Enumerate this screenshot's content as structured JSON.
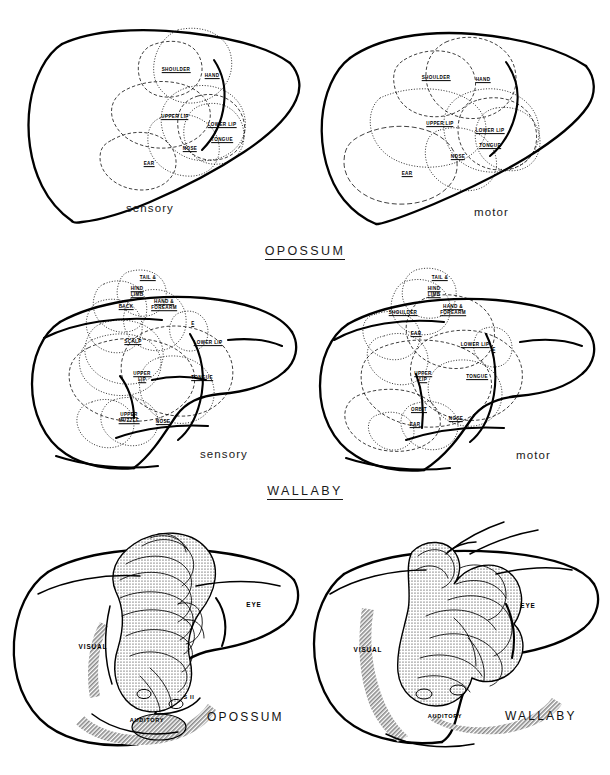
{
  "figure": {
    "background": "#ffffff",
    "ink": "#000000",
    "sections": [
      {
        "id": "opossum-cortex",
        "heading": "OPOSSUM"
      },
      {
        "id": "wallaby-cortex",
        "heading": "WALLABY"
      }
    ]
  },
  "panels": {
    "opossum_sensory": {
      "caption": "sensory",
      "species": "OPOSSUM",
      "modality": "sensory",
      "labels": [
        {
          "text": "SHOULDER",
          "x": 176,
          "y": 70
        },
        {
          "text": "HAND",
          "x": 212,
          "y": 76
        },
        {
          "text": "UPPER LIP",
          "x": 175,
          "y": 117
        },
        {
          "text": "LOWER LIP",
          "x": 222,
          "y": 125
        },
        {
          "text": "TONGUE",
          "x": 222,
          "y": 140
        },
        {
          "text": "NOSE",
          "x": 190,
          "y": 149
        },
        {
          "text": "EAR",
          "x": 149,
          "y": 164
        }
      ]
    },
    "opossum_motor": {
      "caption": "motor",
      "species": "OPOSSUM",
      "modality": "motor",
      "labels": [
        {
          "text": "SHOULDER",
          "x": 436,
          "y": 78
        },
        {
          "text": "HAND",
          "x": 483,
          "y": 80
        },
        {
          "text": "UPPER LIP",
          "x": 440,
          "y": 124
        },
        {
          "text": "LOWER LIP",
          "x": 490,
          "y": 131
        },
        {
          "text": "TONGUE",
          "x": 490,
          "y": 146
        },
        {
          "text": "NOSE",
          "x": 458,
          "y": 157
        },
        {
          "text": "EAR",
          "x": 407,
          "y": 174
        }
      ]
    },
    "wallaby_sensory": {
      "caption": "sensory",
      "species": "WALLABY",
      "modality": "sensory",
      "labels": [
        {
          "text": "TAIL &",
          "x": 148,
          "y": 278
        },
        {
          "text": "HIND|LIMB",
          "x": 137,
          "y": 292
        },
        {
          "text": "BACK",
          "x": 126,
          "y": 307
        },
        {
          "text": "HAND &|FOREARM",
          "x": 164,
          "y": 305
        },
        {
          "text": "E",
          "x": 193,
          "y": 324
        },
        {
          "text": "SCALP",
          "x": 133,
          "y": 342
        },
        {
          "text": "LOWER LIP",
          "x": 208,
          "y": 343
        },
        {
          "text": "UPPER|LIP",
          "x": 142,
          "y": 377
        },
        {
          "text": "TONGUE",
          "x": 202,
          "y": 378
        },
        {
          "text": "UPPER|MUZZLE",
          "x": 129,
          "y": 418
        },
        {
          "text": "NOSE",
          "x": 163,
          "y": 422
        }
      ]
    },
    "wallaby_motor": {
      "caption": "motor",
      "species": "WALLABY",
      "modality": "motor",
      "labels": [
        {
          "text": "TAIL &",
          "x": 440,
          "y": 278
        },
        {
          "text": "HIND|LIMB",
          "x": 434,
          "y": 292
        },
        {
          "text": "SHOULDER",
          "x": 403,
          "y": 313
        },
        {
          "text": "HAND &|FOREARM",
          "x": 453,
          "y": 310
        },
        {
          "text": "EAR",
          "x": 416,
          "y": 334
        },
        {
          "text": "LOWER LIP",
          "x": 475,
          "y": 345
        },
        {
          "text": "E",
          "x": 494,
          "y": 350
        },
        {
          "text": "UPPER|LIP",
          "x": 423,
          "y": 377
        },
        {
          "text": "TONGUE",
          "x": 477,
          "y": 377
        },
        {
          "text": "ORBIT",
          "x": 419,
          "y": 410
        },
        {
          "text": "EAR",
          "x": 415,
          "y": 425
        },
        {
          "text": "NOSE",
          "x": 456,
          "y": 419
        }
      ]
    },
    "opossum_fields": {
      "species_caption": "OPOSSUM",
      "labels": [
        {
          "text": "VISUAL",
          "x": 93,
          "y": 646,
          "size": "big"
        },
        {
          "text": "EYE",
          "x": 254,
          "y": 604,
          "size": "big"
        },
        {
          "text": "S II",
          "x": 189,
          "y": 697,
          "size": "small"
        },
        {
          "text": "AUDITORY",
          "x": 147,
          "y": 720,
          "size": "small"
        }
      ]
    },
    "wallaby_fields": {
      "species_caption": "WALLABY",
      "labels": [
        {
          "text": "VISUAL",
          "x": 368,
          "y": 649,
          "size": "big"
        },
        {
          "text": "EYE",
          "x": 528,
          "y": 605,
          "size": "big"
        },
        {
          "text": "AUDITORY",
          "x": 445,
          "y": 716,
          "size": "small"
        }
      ]
    }
  }
}
